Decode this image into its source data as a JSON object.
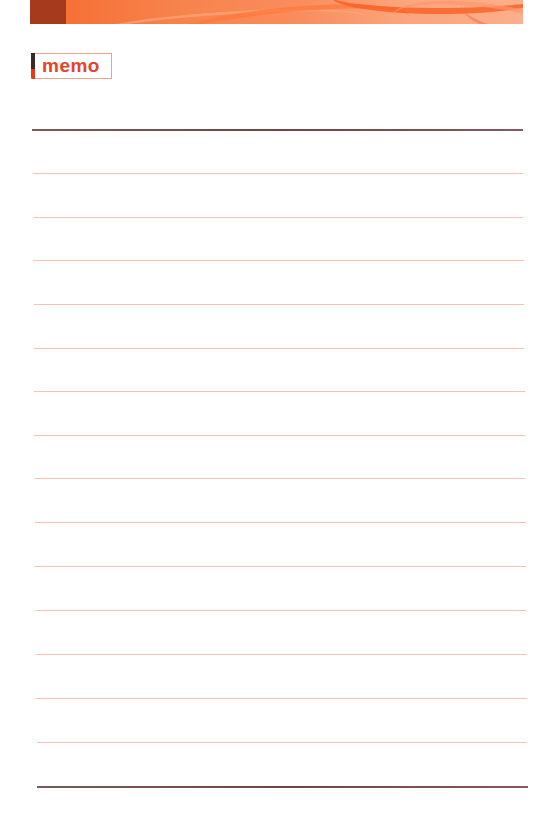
{
  "page": {
    "type": "memo-notepad",
    "width": 553,
    "height": 830
  },
  "header": {
    "banner_colors": {
      "dark_block": "#a53a1c",
      "gradient_start": "#f56a2e",
      "gradient_end": "#fbaf8a"
    }
  },
  "badge": {
    "label": "memo",
    "text_color": "#e8432a",
    "border_color": "#f0a08c",
    "accent_top": "#3a2a28",
    "accent_bottom": "#e63a1e"
  },
  "ruled_lines": {
    "top_border_color": "#6e4646",
    "line_color": "#f3c2b6",
    "lines": [
      {
        "y": 129,
        "x1": 32,
        "x2": 523,
        "style": "dark"
      },
      {
        "y": 173,
        "x1": 33,
        "x2": 523,
        "style": "light"
      },
      {
        "y": 217,
        "x1": 33,
        "x2": 523,
        "style": "light"
      },
      {
        "y": 260,
        "x1": 33,
        "x2": 524,
        "style": "light"
      },
      {
        "y": 304,
        "x1": 34,
        "x2": 524,
        "style": "light"
      },
      {
        "y": 348,
        "x1": 34,
        "x2": 524,
        "style": "light"
      },
      {
        "y": 391,
        "x1": 34,
        "x2": 525,
        "style": "light"
      },
      {
        "y": 435,
        "x1": 34,
        "x2": 525,
        "style": "light"
      },
      {
        "y": 478,
        "x1": 35,
        "x2": 525,
        "style": "light"
      },
      {
        "y": 522,
        "x1": 35,
        "x2": 526,
        "style": "light"
      },
      {
        "y": 566,
        "x1": 35,
        "x2": 526,
        "style": "light"
      },
      {
        "y": 610,
        "x1": 36,
        "x2": 526,
        "style": "light"
      },
      {
        "y": 654,
        "x1": 36,
        "x2": 527,
        "style": "light"
      },
      {
        "y": 698,
        "x1": 36,
        "x2": 527,
        "style": "light"
      },
      {
        "y": 742,
        "x1": 37,
        "x2": 527,
        "style": "light"
      },
      {
        "y": 786,
        "x1": 37,
        "x2": 528,
        "style": "dark"
      }
    ]
  }
}
